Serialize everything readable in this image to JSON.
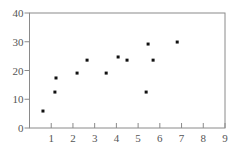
{
  "chart_data": {
    "type": "scatter",
    "title": "",
    "xlabel": "",
    "ylabel": "",
    "xlim": [
      0,
      9
    ],
    "ylim": [
      0,
      40
    ],
    "x_ticks": [
      0,
      1,
      2,
      3,
      4,
      5,
      6,
      7,
      8,
      9
    ],
    "y_ticks": [
      0,
      10,
      20,
      30,
      40
    ],
    "grid": false,
    "legend": null,
    "series": [
      {
        "name": "points",
        "marker_color": "#111111",
        "points": [
          {
            "x": 0.62,
            "y": 5.9
          },
          {
            "x": 1.17,
            "y": 12.5
          },
          {
            "x": 1.22,
            "y": 17.4
          },
          {
            "x": 2.19,
            "y": 19.1
          },
          {
            "x": 2.65,
            "y": 23.6
          },
          {
            "x": 3.53,
            "y": 19.1
          },
          {
            "x": 4.08,
            "y": 24.7
          },
          {
            "x": 4.49,
            "y": 23.6
          },
          {
            "x": 5.46,
            "y": 29.2
          },
          {
            "x": 5.69,
            "y": 23.6
          },
          {
            "x": 5.37,
            "y": 12.5
          },
          {
            "x": 6.8,
            "y": 29.9
          }
        ]
      }
    ]
  },
  "style": {
    "axis_color": "#8a8a8a",
    "tick_label_color": "#555555",
    "background": "#ffffff"
  }
}
